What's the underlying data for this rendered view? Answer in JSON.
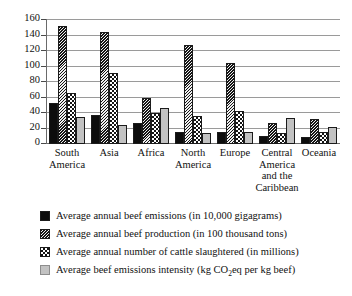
{
  "chart_data": {
    "type": "bar",
    "title": "",
    "xlabel": "",
    "ylabel": "",
    "ylim": [
      0,
      160
    ],
    "ytick_step": 20,
    "yticks": [
      160,
      140,
      120,
      100,
      80,
      60,
      40,
      20,
      0
    ],
    "grid": true,
    "grid_axis": "y",
    "legend_position": "bottom",
    "categories": [
      "South America",
      "Asia",
      "Africa",
      "North America",
      "Europe",
      "Central America and the Caribbean",
      "Oceania"
    ],
    "series": [
      {
        "name": "Average annual beef emissions (in 10,000 gigagrams)",
        "pattern": "solid-black",
        "color": "#0d0d0d",
        "values": [
          53,
          38,
          27,
          16,
          16,
          10,
          9
        ]
      },
      {
        "name": "Average annual beef production (in 100 thousand tons)",
        "pattern": "diagonal-hatch",
        "color": "#4a4a4a",
        "values": [
          152,
          144,
          60,
          128,
          105,
          27,
          32
        ]
      },
      {
        "name": "Average annual number of cattle slaughtered (in millions)",
        "pattern": "checkerboard",
        "color": "#2b2b2b",
        "values": [
          66,
          92,
          40,
          36,
          42,
          14,
          15
        ]
      },
      {
        "name": "Average beef emissions intensity (kg CO2eq per kg beef)",
        "pattern": "light-gray",
        "color": "#c2c2c2",
        "values": [
          35,
          25,
          47,
          14,
          16,
          33,
          22
        ]
      }
    ]
  },
  "axis": {
    "y_tick_labels": [
      "160",
      "140",
      "120",
      "100",
      "80",
      "60",
      "40",
      "20",
      "0"
    ],
    "x_category_lines": [
      [
        "South",
        "America"
      ],
      [
        "Asia"
      ],
      [
        "Africa"
      ],
      [
        "North",
        "America"
      ],
      [
        "Europe"
      ],
      [
        "Central",
        "America",
        "and the",
        "Caribbean"
      ],
      [
        "Oceania"
      ]
    ]
  },
  "legend": {
    "items": [
      {
        "label_pre": "Average annual beef emissions (in 10,000 gigagrams)",
        "label_sub": "",
        "label_post": "",
        "swatch": "swatch-solid-black"
      },
      {
        "label_pre": "Average annual beef production (in 100 thousand tons)",
        "label_sub": "",
        "label_post": "",
        "swatch": "swatch-diagonal-hatch"
      },
      {
        "label_pre": "Average annual number of cattle slaughtered (in millions)",
        "label_sub": "",
        "label_post": "",
        "swatch": "swatch-checkerboard"
      },
      {
        "label_pre": "Average beef emissions intensity (kg CO",
        "label_sub": "2",
        "label_post": "eq per kg beef)",
        "swatch": "swatch-light-gray"
      }
    ]
  }
}
